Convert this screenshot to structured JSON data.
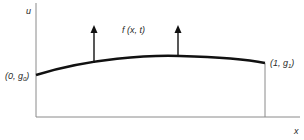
{
  "diagram": {
    "axes": {
      "y_label": "u",
      "x_label": "x"
    },
    "force_label": "f (x, t)",
    "left_boundary": {
      "prefix": "(0, g",
      "subscript": "0",
      "suffix": ")"
    },
    "right_boundary": {
      "prefix": "(1, g",
      "subscript": "1",
      "suffix": ")"
    },
    "colors": {
      "line": "#111111",
      "axis": "#777777",
      "text": "#2a2a2a"
    }
  }
}
